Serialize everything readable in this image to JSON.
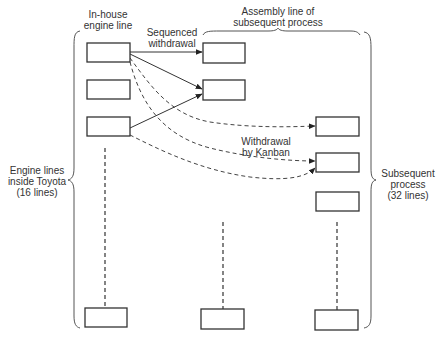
{
  "labels": {
    "in_house": [
      "In-house",
      "engine line"
    ],
    "assembly": [
      "Assembly line of",
      "subsequent process"
    ],
    "sequenced": [
      "Sequenced",
      "withdrawal"
    ],
    "kanban": [
      "Withdrawal",
      "by Kanban"
    ],
    "engine_lines": [
      "Engine lines",
      "inside Toyota",
      "(16 lines)"
    ],
    "subsequent": [
      "Subsequent",
      "process",
      "(32 lines)"
    ]
  },
  "groups": {
    "engine_lines": {
      "name": "Engine lines inside Toyota",
      "count": 16
    },
    "subsequent_process": {
      "name": "Subsequent process",
      "count": 32
    }
  },
  "nodes": {
    "left": [
      {
        "x": 87,
        "y": 43,
        "w": 43,
        "h": 19
      },
      {
        "x": 87,
        "y": 80,
        "w": 43,
        "h": 19
      },
      {
        "x": 87,
        "y": 117,
        "w": 43,
        "h": 19
      },
      {
        "x": 85,
        "y": 308,
        "w": 42,
        "h": 19
      }
    ],
    "middle": [
      {
        "x": 203,
        "y": 43,
        "w": 42,
        "h": 20
      },
      {
        "x": 203,
        "y": 80,
        "w": 42,
        "h": 20
      },
      {
        "x": 201,
        "y": 309,
        "w": 43,
        "h": 20
      }
    ],
    "right": [
      {
        "x": 316,
        "y": 117,
        "w": 43,
        "h": 19
      },
      {
        "x": 316,
        "y": 153,
        "w": 43,
        "h": 19
      },
      {
        "x": 316,
        "y": 192,
        "w": 43,
        "h": 19
      },
      {
        "x": 315,
        "y": 310,
        "w": 43,
        "h": 20
      }
    ]
  },
  "edges": {
    "sequenced": [
      {
        "from": "left.0",
        "to": "middle.0"
      },
      {
        "from": "left.0",
        "to": "middle.1"
      },
      {
        "from": "left.2",
        "to": "middle.1"
      }
    ],
    "kanban": [
      {
        "from": "left.0",
        "to": "right.0"
      },
      {
        "from": "left.0",
        "to": "right.1"
      },
      {
        "from": "left.2",
        "to": "right.1"
      }
    ]
  },
  "colors": {
    "stroke": "#333333",
    "brace": "#555555",
    "background": "#ffffff"
  }
}
